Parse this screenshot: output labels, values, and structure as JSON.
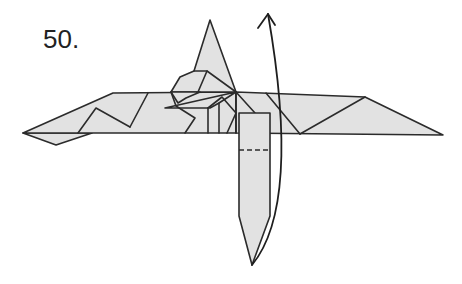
{
  "diagram": {
    "step_label": "50.",
    "colors": {
      "paper_fill": "#e2e2e2",
      "line": "#2b2b2b",
      "background": "#ffffff"
    },
    "elements": {
      "model": "origami-model-front-view",
      "head": "pointed-head-flap",
      "left_wing": "left-wing",
      "right_wing": "right-wing",
      "tail_flap": "vertical-tail-flap",
      "valley_fold": "dashed-valley-fold-line",
      "fold_arrow": "curved-fold-up-arrow"
    },
    "instruction": "Fold the lower flap up along the dashed valley line"
  }
}
